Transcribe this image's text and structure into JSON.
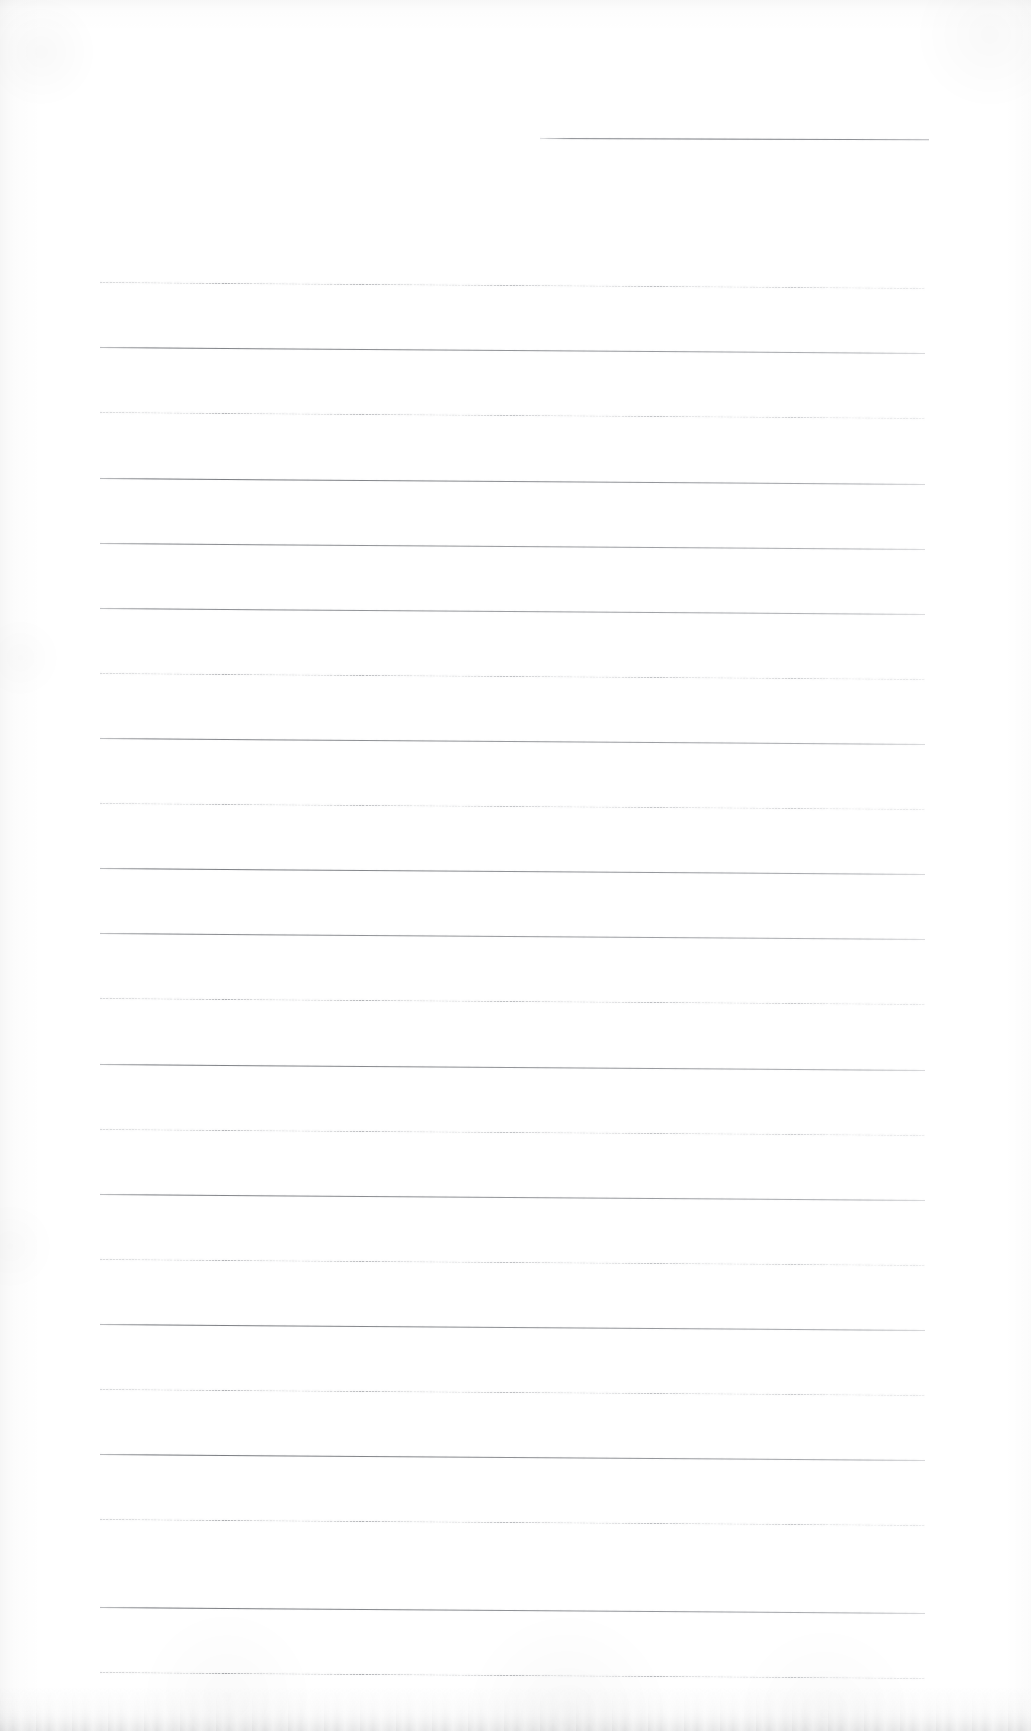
{
  "document": {
    "kind": "scanned-blank-lined-page",
    "title": "Blank Ruled Notebook Page",
    "page_width": 1031,
    "page_height": 1731,
    "paper_color": "#ffffff",
    "rule_color": "#6e7177",
    "rule_color_light": "#9a9ca2",
    "orientation": "portrait",
    "text_content": "",
    "has_handwriting": false,
    "has_printed_text": false
  },
  "header_rule": {
    "name": "top-short-rule",
    "x": 540,
    "y": 138,
    "width": 389,
    "slope_deg": 0.18,
    "style": "solid"
  },
  "body_rules": {
    "left": 100,
    "right": 925,
    "width": 825,
    "first_y": 282,
    "spacing": 65.2,
    "count": 22,
    "slope_deg": 0.42,
    "lines": [
      {
        "index": 1,
        "y": 282,
        "style": "stipple",
        "weight": 0.62
      },
      {
        "index": 2,
        "y": 347,
        "style": "solid",
        "weight": 0.85
      },
      {
        "index": 3,
        "y": 412,
        "style": "stipple",
        "weight": 0.58
      },
      {
        "index": 4,
        "y": 478,
        "style": "solid",
        "weight": 0.9
      },
      {
        "index": 5,
        "y": 543,
        "style": "solid",
        "weight": 0.8
      },
      {
        "index": 6,
        "y": 608,
        "style": "solid",
        "weight": 0.78
      },
      {
        "index": 7,
        "y": 673,
        "style": "stipple",
        "weight": 0.6
      },
      {
        "index": 8,
        "y": 738,
        "style": "solid",
        "weight": 0.82
      },
      {
        "index": 9,
        "y": 803,
        "style": "stipple",
        "weight": 0.56
      },
      {
        "index": 10,
        "y": 868,
        "style": "solid",
        "weight": 0.88
      },
      {
        "index": 11,
        "y": 933,
        "style": "solid",
        "weight": 0.8
      },
      {
        "index": 12,
        "y": 998,
        "style": "stipple",
        "weight": 0.64
      },
      {
        "index": 13,
        "y": 1064,
        "style": "solid",
        "weight": 0.86
      },
      {
        "index": 14,
        "y": 1129,
        "style": "stipple",
        "weight": 0.58
      },
      {
        "index": 15,
        "y": 1194,
        "style": "solid",
        "weight": 0.84
      },
      {
        "index": 16,
        "y": 1259,
        "style": "stipple",
        "weight": 0.6
      },
      {
        "index": 17,
        "y": 1324,
        "style": "solid",
        "weight": 0.88
      },
      {
        "index": 18,
        "y": 1389,
        "style": "stipple",
        "weight": 0.62
      },
      {
        "index": 19,
        "y": 1454,
        "style": "solid",
        "weight": 0.9
      },
      {
        "index": 20,
        "y": 1519,
        "style": "stipple",
        "weight": 0.66
      },
      {
        "index": 21,
        "y": 1607,
        "style": "solid",
        "weight": 0.88
      },
      {
        "index": 22,
        "y": 1672,
        "style": "stipple",
        "weight": 0.7
      }
    ]
  },
  "scan_artifacts": {
    "left_edge_shadow": true,
    "top_edge_smudge": true,
    "bottom_edge_smudge": true,
    "right_edge_shadow": true
  }
}
